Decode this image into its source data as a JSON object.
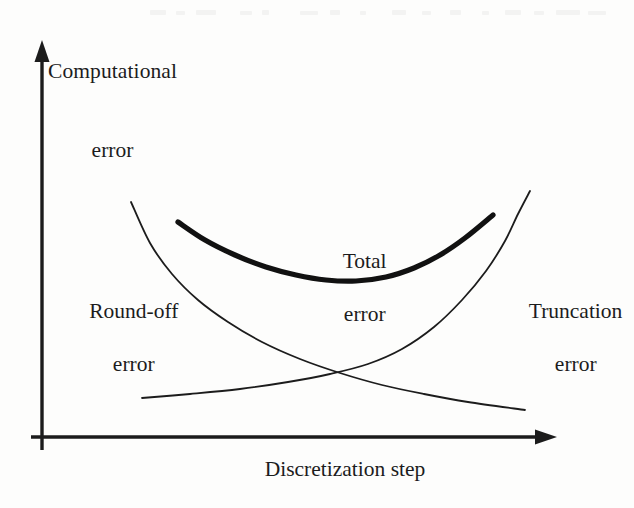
{
  "figure": {
    "kind": "line-diagram",
    "background_color": "#fdfdfc",
    "ink_color": "#1c1c1c",
    "width": 634,
    "height": 508
  },
  "axes": {
    "y_label_line1": "Computational",
    "y_label_line2": "error",
    "x_label": "Discretization step",
    "y_axis_arrow": "arrow-up-icon",
    "x_axis_arrow": "arrow-right-icon",
    "origin": {
      "x": 42,
      "y": 437
    }
  },
  "annotations": {
    "roundoff_line1": "Round-off",
    "roundoff_line2": "error",
    "total_line1": "Total",
    "total_line2": "error",
    "truncation_line1": "Truncation",
    "truncation_line2": "error"
  },
  "chart_data": {
    "type": "line",
    "title": "",
    "xlabel": "Discretization step",
    "ylabel": "Computational error",
    "grid": false,
    "legend": "inline-annotations",
    "axis_style": "arrow-axes-unlabeled-ticks",
    "xlim": [
      0,
      1
    ],
    "ylim": [
      0,
      1
    ],
    "series": [
      {
        "name": "Round-off error",
        "style": "thin",
        "stroke_width": 1.8,
        "color": "#1c1c1c",
        "shape": "monotonic-decreasing-convex",
        "points_px": [
          [
            131,
            202
          ],
          [
            150,
            243
          ],
          [
            172,
            274
          ],
          [
            198,
            300
          ],
          [
            228,
            322
          ],
          [
            262,
            342
          ],
          [
            300,
            359
          ],
          [
            340,
            373
          ],
          [
            382,
            385
          ],
          [
            424,
            394
          ],
          [
            468,
            402
          ],
          [
            525,
            410
          ]
        ]
      },
      {
        "name": "Truncation error",
        "style": "thin",
        "stroke_width": 1.8,
        "color": "#1c1c1c",
        "shape": "monotonic-increasing-convex",
        "points_px": [
          [
            142,
            398
          ],
          [
            190,
            394
          ],
          [
            240,
            389
          ],
          [
            288,
            382
          ],
          [
            330,
            374
          ],
          [
            368,
            364
          ],
          [
            402,
            349
          ],
          [
            434,
            327
          ],
          [
            462,
            300
          ],
          [
            486,
            271
          ],
          [
            505,
            241
          ],
          [
            518,
            214
          ],
          [
            530,
            191
          ]
        ]
      },
      {
        "name": "Total error",
        "style": "thick",
        "stroke_width": 5.2,
        "color": "#111111",
        "shape": "u-shaped-minimum",
        "points_px": [
          [
            178,
            222
          ],
          [
            205,
            240
          ],
          [
            235,
            255
          ],
          [
            266,
            267
          ],
          [
            296,
            275
          ],
          [
            326,
            280
          ],
          [
            356,
            281
          ],
          [
            386,
            277
          ],
          [
            414,
            268
          ],
          [
            440,
            255
          ],
          [
            465,
            238
          ],
          [
            493,
            215
          ]
        ],
        "minimum_px": [
          346,
          281
        ]
      }
    ],
    "crossing_point_px": [
      372,
      372
    ]
  }
}
